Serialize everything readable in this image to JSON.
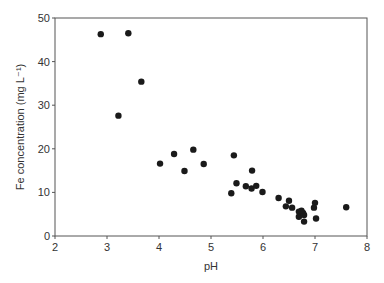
{
  "chart_data": {
    "type": "scatter",
    "title": "",
    "xlabel": "pH",
    "ylabel": "Fe concentration (mg L⁻¹)",
    "xlim": [
      2,
      8
    ],
    "ylim": [
      0,
      50
    ],
    "xticks": [
      2,
      3,
      4,
      5,
      6,
      7,
      8
    ],
    "yticks": [
      0,
      10,
      20,
      30,
      40,
      50
    ],
    "grid": false,
    "legend": null,
    "marker_color": "#1a1a1a",
    "series": [
      {
        "name": "Fe vs pH",
        "points": [
          [
            2.88,
            46.3
          ],
          [
            3.41,
            46.5
          ],
          [
            3.66,
            35.4
          ],
          [
            3.22,
            27.6
          ],
          [
            4.02,
            16.6
          ],
          [
            4.29,
            18.8
          ],
          [
            4.49,
            14.9
          ],
          [
            4.66,
            19.8
          ],
          [
            4.86,
            16.5
          ],
          [
            5.44,
            18.5
          ],
          [
            5.39,
            9.8
          ],
          [
            5.49,
            12.1
          ],
          [
            5.67,
            11.4
          ],
          [
            5.79,
            15.0
          ],
          [
            5.78,
            10.9
          ],
          [
            5.87,
            11.5
          ],
          [
            5.99,
            10.1
          ],
          [
            6.3,
            8.7
          ],
          [
            6.5,
            8.1
          ],
          [
            6.44,
            6.8
          ],
          [
            6.56,
            6.5
          ],
          [
            6.69,
            5.6
          ],
          [
            6.69,
            4.4
          ],
          [
            6.77,
            5.3
          ],
          [
            6.79,
            4.8
          ],
          [
            6.79,
            3.3
          ],
          [
            6.74,
            5.8
          ],
          [
            7.0,
            7.6
          ],
          [
            6.98,
            6.5
          ],
          [
            7.02,
            4.0
          ],
          [
            7.6,
            6.6
          ]
        ]
      }
    ]
  }
}
